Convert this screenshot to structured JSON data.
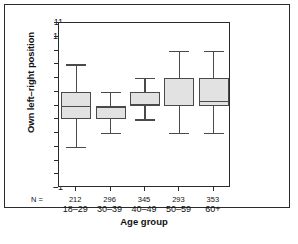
{
  "figure": {
    "caption": ""
  },
  "chart_data": {
    "type": "box",
    "title": "",
    "xlabel": "Age group",
    "ylabel": "Own left–right position",
    "categories": [
      "18–29",
      "30–39",
      "40–49",
      "50–59",
      "60+"
    ],
    "n_label": "N =",
    "n_values": [
      212,
      296,
      345,
      293,
      353
    ],
    "ylim": [
      -1,
      11
    ],
    "yticks": [
      11,
      10,
      9,
      8,
      7,
      6,
      5,
      4,
      3,
      2,
      1,
      0,
      -1
    ],
    "ytick_labels": [
      "11",
      "10",
      "9",
      "8",
      "7",
      "6",
      "5",
      "4",
      "3",
      "2",
      "1",
      "0",
      "–1"
    ],
    "grid": false,
    "legend": null,
    "box_fill": "#e2e2e2",
    "box_stroke": "#4a4a4a",
    "axis_color": "#2b2b2b",
    "boxes": [
      {
        "category": "18–29",
        "n": 212,
        "whisker_low": 2,
        "q1": 4,
        "median": 5,
        "q3": 6,
        "whisker_high": 8
      },
      {
        "category": "30–39",
        "n": 296,
        "whisker_low": 3,
        "q1": 4,
        "median": 4.9,
        "q3": 5,
        "whisker_high": 6
      },
      {
        "category": "40–49",
        "n": 345,
        "whisker_low": 4,
        "q1": 5,
        "median": 5.1,
        "q3": 6,
        "whisker_high": 7
      },
      {
        "category": "50–59",
        "n": 293,
        "whisker_low": 3,
        "q1": 5,
        "median": 7,
        "q3": 7,
        "whisker_high": 9
      },
      {
        "category": "60+",
        "n": 353,
        "whisker_low": 3,
        "q1": 5,
        "median": 5.35,
        "q3": 7,
        "whisker_high": 9
      }
    ]
  }
}
